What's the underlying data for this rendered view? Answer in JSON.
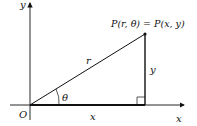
{
  "diagram": {
    "type": "polar-cartesian-relation",
    "labels": {
      "y_axis": "y",
      "x_axis": "x",
      "origin": "O",
      "point": "P(r, θ) = P(x, y)",
      "hypotenuse": "r",
      "angle": "θ",
      "vertical_leg": "y",
      "horizontal_leg": "x"
    },
    "colors": {
      "line": "#111111",
      "background": "#ffffff"
    }
  }
}
